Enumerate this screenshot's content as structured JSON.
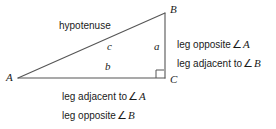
{
  "figure": {
    "vertices": {
      "a": "A",
      "b": "B",
      "c": "C"
    },
    "sides": {
      "hypotenuse_name": "hypotenuse",
      "hypotenuse_var": "c",
      "base_var": "b",
      "vertical_var": "a"
    },
    "right_angle_at": "C",
    "colors": {
      "line": "#555555",
      "text": "#1a1a1a",
      "background": "#ffffff"
    },
    "geometry": {
      "A": [
        18,
        78
      ],
      "B": [
        165,
        13
      ],
      "C": [
        165,
        78
      ],
      "right_angle_marker_size": 8
    }
  },
  "right_text": {
    "line1": {
      "prefix": "leg opposite",
      "angle": "∠",
      "variable": "A"
    },
    "line2": {
      "prefix": "leg adjacent to",
      "angle": "∠",
      "variable": "B"
    }
  },
  "bottom_text": {
    "line1": {
      "prefix": "leg adjacent to",
      "angle": "∠",
      "variable": "A"
    },
    "line2": {
      "prefix": "leg opposite",
      "angle": "∠",
      "variable": "B"
    }
  }
}
